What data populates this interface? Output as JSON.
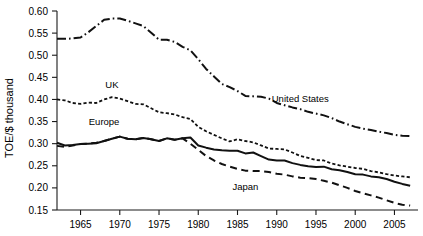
{
  "chart_data": {
    "type": "line",
    "title": "",
    "xlabel": "",
    "ylabel": "TOE/$ thousand",
    "xlim": [
      1962,
      2008
    ],
    "ylim": [
      0.15,
      0.6
    ],
    "xticks": [
      1965,
      1970,
      1975,
      1980,
      1985,
      1990,
      1995,
      2000,
      2005
    ],
    "yticks": [
      0.15,
      0.2,
      0.25,
      0.3,
      0.35,
      0.4,
      0.45,
      0.5,
      0.55,
      0.6
    ],
    "ytick_labels": [
      "0.15",
      "0.20",
      "0.25",
      "0.30",
      "0.35",
      "0.40",
      "0.45",
      "0.50",
      "0.55",
      "0.60"
    ],
    "xtick_labels": [
      "1965",
      "1970",
      "1975",
      "1980",
      "1985",
      "1990",
      "1995",
      "2000",
      "2005"
    ],
    "grid": false,
    "legend_position": "inline-annotations",
    "series": [
      {
        "name": "United States",
        "style": "dash-dot",
        "label_x": 1993,
        "label_y": 0.395,
        "x": [
          1962,
          1963,
          1964,
          1965,
          1966,
          1967,
          1968,
          1969,
          1970,
          1971,
          1972,
          1973,
          1974,
          1975,
          1976,
          1977,
          1978,
          1979,
          1980,
          1981,
          1982,
          1983,
          1984,
          1985,
          1986,
          1987,
          1988,
          1989,
          1990,
          1991,
          1992,
          1993,
          1994,
          1995,
          1996,
          1997,
          1998,
          1999,
          2000,
          2001,
          2002,
          2003,
          2004,
          2005,
          2006,
          2007
        ],
        "values": [
          0.537,
          0.537,
          0.538,
          0.54,
          0.552,
          0.566,
          0.58,
          0.583,
          0.583,
          0.578,
          0.572,
          0.566,
          0.551,
          0.535,
          0.535,
          0.53,
          0.519,
          0.511,
          0.491,
          0.469,
          0.452,
          0.435,
          0.428,
          0.419,
          0.408,
          0.407,
          0.406,
          0.402,
          0.392,
          0.387,
          0.382,
          0.378,
          0.372,
          0.368,
          0.364,
          0.358,
          0.35,
          0.344,
          0.338,
          0.334,
          0.331,
          0.327,
          0.324,
          0.32,
          0.318,
          0.317
        ]
      },
      {
        "name": "UK",
        "style": "dotted",
        "label_x": 1969,
        "label_y": 0.427,
        "x": [
          1962,
          1963,
          1964,
          1965,
          1966,
          1967,
          1968,
          1969,
          1970,
          1971,
          1972,
          1973,
          1974,
          1975,
          1976,
          1977,
          1978,
          1979,
          1980,
          1981,
          1982,
          1983,
          1984,
          1985,
          1986,
          1987,
          1988,
          1989,
          1990,
          1991,
          1992,
          1993,
          1994,
          1995,
          1996,
          1997,
          1998,
          1999,
          2000,
          2001,
          2002,
          2003,
          2004,
          2005,
          2006,
          2007
        ],
        "values": [
          0.4,
          0.398,
          0.392,
          0.39,
          0.393,
          0.392,
          0.4,
          0.405,
          0.402,
          0.396,
          0.39,
          0.389,
          0.38,
          0.371,
          0.369,
          0.366,
          0.36,
          0.356,
          0.338,
          0.328,
          0.32,
          0.312,
          0.305,
          0.31,
          0.306,
          0.303,
          0.296,
          0.289,
          0.288,
          0.287,
          0.28,
          0.272,
          0.268,
          0.263,
          0.262,
          0.255,
          0.251,
          0.248,
          0.245,
          0.243,
          0.238,
          0.235,
          0.231,
          0.228,
          0.226,
          0.224
        ]
      },
      {
        "name": "Europe",
        "style": "solid",
        "label_x": 1968,
        "label_y": 0.342,
        "x": [
          1962,
          1963,
          1964,
          1965,
          1966,
          1967,
          1968,
          1969,
          1970,
          1971,
          1972,
          1973,
          1974,
          1975,
          1976,
          1977,
          1978,
          1979,
          1980,
          1981,
          1982,
          1983,
          1984,
          1985,
          1986,
          1987,
          1988,
          1989,
          1990,
          1991,
          1992,
          1993,
          1994,
          1995,
          1996,
          1997,
          1998,
          1999,
          2000,
          2001,
          2002,
          2003,
          2004,
          2005,
          2006,
          2007
        ],
        "values": [
          0.302,
          0.296,
          0.297,
          0.299,
          0.3,
          0.301,
          0.306,
          0.311,
          0.316,
          0.311,
          0.31,
          0.313,
          0.31,
          0.306,
          0.312,
          0.309,
          0.312,
          0.314,
          0.296,
          0.291,
          0.287,
          0.285,
          0.284,
          0.284,
          0.278,
          0.28,
          0.272,
          0.264,
          0.262,
          0.262,
          0.256,
          0.252,
          0.249,
          0.247,
          0.248,
          0.242,
          0.24,
          0.236,
          0.231,
          0.23,
          0.226,
          0.224,
          0.22,
          0.214,
          0.209,
          0.205
        ]
      },
      {
        "name": "Japan",
        "style": "dashed",
        "label_x": 1986,
        "label_y": 0.196,
        "x": [
          1962,
          1963,
          1964,
          1965,
          1966,
          1967,
          1968,
          1969,
          1970,
          1971,
          1972,
          1973,
          1974,
          1975,
          1976,
          1977,
          1978,
          1979,
          1980,
          1981,
          1982,
          1983,
          1984,
          1985,
          1986,
          1987,
          1988,
          1989,
          1990,
          1991,
          1992,
          1993,
          1994,
          1995,
          1996,
          1997,
          1998,
          1999,
          2000,
          2001,
          2002,
          2003,
          2004,
          2005,
          2006,
          2007
        ],
        "values": [
          0.295,
          0.293,
          0.296,
          0.299,
          0.3,
          0.302,
          0.306,
          0.311,
          0.316,
          0.311,
          0.31,
          0.313,
          0.31,
          0.306,
          0.312,
          0.309,
          0.312,
          0.3,
          0.286,
          0.272,
          0.262,
          0.254,
          0.248,
          0.243,
          0.239,
          0.238,
          0.238,
          0.236,
          0.232,
          0.23,
          0.226,
          0.223,
          0.222,
          0.22,
          0.216,
          0.212,
          0.206,
          0.2,
          0.193,
          0.188,
          0.183,
          0.178,
          0.172,
          0.166,
          0.162,
          0.16
        ]
      }
    ]
  }
}
